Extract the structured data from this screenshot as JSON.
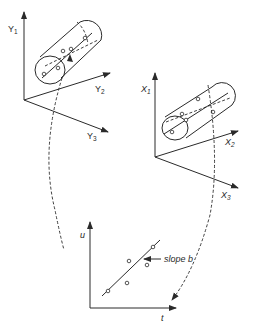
{
  "diagram": {
    "top_left_axes": {
      "axis_1": {
        "label": "Y",
        "subscript": "1"
      },
      "axis_2": {
        "label": "Y",
        "subscript": "2"
      },
      "axis_3": {
        "label": "Y",
        "subscript": "3"
      }
    },
    "right_axes": {
      "axis_1": {
        "label": "X",
        "subscript": "1"
      },
      "axis_2": {
        "label": "X",
        "subscript": "2"
      },
      "axis_3": {
        "label": "X",
        "subscript": "3"
      }
    },
    "bottom_plot": {
      "y_label": "u",
      "x_label": "t",
      "annotation": "slope b",
      "points": [
        {
          "t": 108,
          "u": 291
        },
        {
          "t": 127,
          "u": 283
        },
        {
          "t": 129,
          "u": 261
        },
        {
          "t": 147,
          "u": 265
        },
        {
          "t": 153,
          "u": 247
        }
      ]
    },
    "colors": {
      "ink": "#2a2a2a",
      "background": "#ffffff"
    }
  }
}
